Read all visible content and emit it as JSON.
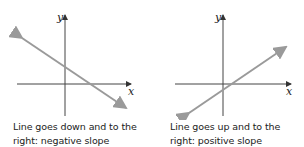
{
  "panels": [
    {
      "id": "negative",
      "axis_x_label": "x",
      "axis_y_label": "y",
      "caption_line1": "Line goes down and to the",
      "caption_line2": "right: negative slope",
      "slope_sign": "negative"
    },
    {
      "id": "positive",
      "axis_x_label": "x",
      "axis_y_label": "y",
      "caption_line1": "Line goes up and to the",
      "caption_line2": "right: positive slope",
      "slope_sign": "positive"
    }
  ],
  "colors": {
    "axis": "#444444",
    "line": "#9a9a9a",
    "text": "#222222"
  }
}
